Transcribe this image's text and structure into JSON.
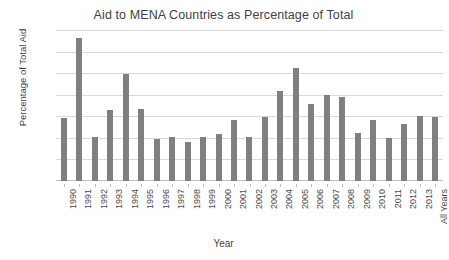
{
  "chart_data": {
    "type": "bar",
    "title": "Aid to MENA Countries as Percentage of Total",
    "xlabel": "Year",
    "ylabel": "Percentage of Total Aid",
    "ylim": [
      0,
      35
    ],
    "yticks": [
      0,
      5,
      10,
      15,
      20,
      25,
      30,
      35
    ],
    "grid": true,
    "legend": "none",
    "bar_color": "#808080",
    "gridline_color": "#d9d9d9",
    "categories": [
      "1990",
      "1991",
      "1992",
      "1993",
      "1994",
      "1995",
      "1996",
      "1997",
      "1998",
      "1999",
      "2000",
      "2001",
      "2002",
      "2003",
      "2004",
      "2005",
      "2006",
      "2007",
      "2008",
      "2009",
      "2010",
      "2011",
      "2012",
      "2013",
      "All Years"
    ],
    "values": [
      14.6,
      33.1,
      10.2,
      16.5,
      24.8,
      16.6,
      9.8,
      10.3,
      9.0,
      10.3,
      11.0,
      14.2,
      10.2,
      14.8,
      20.8,
      26.2,
      17.9,
      20.0,
      19.5,
      11.2,
      14.2,
      9.9,
      13.3,
      15.1,
      14.9
    ]
  }
}
